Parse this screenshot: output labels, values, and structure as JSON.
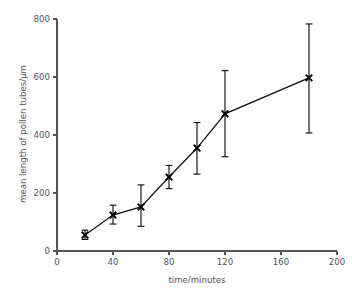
{
  "chart_data": {
    "type": "line",
    "title": "",
    "subtitle": "",
    "xlabel": "time/minutes",
    "ylabel": "mean length of pollen tubes/µm",
    "xlim": [
      0,
      200
    ],
    "ylim": [
      0,
      800
    ],
    "xticks": [
      0,
      40,
      80,
      120,
      160,
      200
    ],
    "yticks": [
      0,
      200,
      400,
      600,
      800
    ],
    "xtick_labels": [
      "0",
      "40",
      "80",
      "120",
      "160",
      "200"
    ],
    "ytick_labels": [
      "0",
      "200",
      "400",
      "600",
      "800"
    ],
    "grid": false,
    "legend": null,
    "marker": "x",
    "error_bars": "vertical",
    "x": [
      20,
      40,
      60,
      80,
      100,
      120,
      180
    ],
    "values": [
      55,
      124,
      152,
      255,
      355,
      473,
      597
    ],
    "y_err_lower": [
      40,
      93,
      85,
      215,
      265,
      325,
      407
    ],
    "y_err_upper": [
      72,
      158,
      228,
      295,
      443,
      622,
      783
    ],
    "series": [
      {
        "name": "mean length of pollen tubes",
        "x": [
          20,
          40,
          60,
          80,
          100,
          120,
          180
        ],
        "values": [
          55,
          124,
          152,
          255,
          355,
          473,
          597
        ],
        "y_err_lower": [
          40,
          93,
          85,
          215,
          265,
          325,
          407
        ],
        "y_err_upper": [
          72,
          158,
          228,
          295,
          443,
          622,
          783
        ]
      }
    ],
    "colors": {
      "line": "#111111",
      "marker": "#000000",
      "error": "#111111",
      "axis": "#555555",
      "text": "#555555",
      "background": "#ffffff"
    }
  }
}
